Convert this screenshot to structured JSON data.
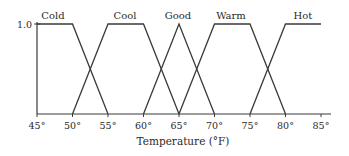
{
  "chart_data": {
    "type": "line",
    "title": "",
    "xlabel": "Temperature (°F)",
    "ylabel": "",
    "xlim": [
      45,
      85
    ],
    "ylim": [
      0,
      1.0
    ],
    "x_ticks": [
      45,
      50,
      55,
      60,
      65,
      70,
      75,
      80,
      85
    ],
    "x_tick_labels": [
      "45°",
      "50°",
      "55°",
      "60°",
      "65°",
      "70°",
      "75°",
      "80°",
      "85°"
    ],
    "y_ticks": [
      1.0
    ],
    "y_tick_labels": [
      "1.0"
    ],
    "grid": false,
    "legend": "inline labels above each membership function",
    "series": [
      {
        "name": "Cold",
        "points": [
          [
            45,
            1.0
          ],
          [
            50,
            1.0
          ],
          [
            55,
            0
          ]
        ]
      },
      {
        "name": "Cool",
        "points": [
          [
            50,
            0
          ],
          [
            55,
            1.0
          ],
          [
            60,
            1.0
          ],
          [
            65,
            0
          ]
        ]
      },
      {
        "name": "Good",
        "points": [
          [
            60,
            0
          ],
          [
            65,
            1.0
          ],
          [
            70,
            0
          ]
        ]
      },
      {
        "name": "Warm",
        "points": [
          [
            65,
            0
          ],
          [
            70,
            1.0
          ],
          [
            75,
            1.0
          ],
          [
            80,
            0
          ]
        ]
      },
      {
        "name": "Hot",
        "points": [
          [
            75,
            0
          ],
          [
            80,
            1.0
          ],
          [
            85,
            1.0
          ]
        ]
      }
    ],
    "label_x": [
      53,
      125,
      178,
      231,
      303
    ]
  },
  "style": {
    "line_color": "#3a3a3a",
    "text_color": "#2a2a2a",
    "background": "#ffffff"
  }
}
